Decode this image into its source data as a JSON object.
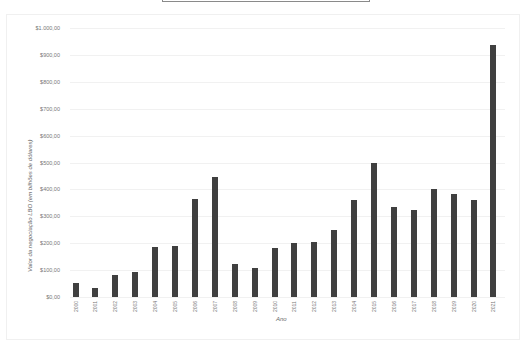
{
  "chart_data": {
    "type": "bar",
    "title": "",
    "xlabel": "Ano",
    "ylabel": "Valor da negociação LBO (em bilhões de dólares)",
    "categories": [
      "2000",
      "2001",
      "2002",
      "2003",
      "2004",
      "2005",
      "2006",
      "2007",
      "2008",
      "2009",
      "2010",
      "2011",
      "2012",
      "2013",
      "2014",
      "2015",
      "2016",
      "2017",
      "2018",
      "2019",
      "2020",
      "2021"
    ],
    "values": [
      52,
      33,
      80,
      92,
      186,
      190,
      364,
      447,
      123,
      108,
      182,
      200,
      204,
      249,
      360,
      498,
      335,
      323,
      401,
      383,
      361,
      937
    ],
    "ylim": [
      0,
      1000
    ],
    "yticks": [
      0,
      100,
      200,
      300,
      400,
      500,
      600,
      700,
      800,
      900,
      1000
    ],
    "ytick_labels": [
      "$0,00",
      "$100,00",
      "$200,00",
      "$300,00",
      "$400,00",
      "$500,00",
      "$600,00",
      "$700,00",
      "$800,00",
      "$900,00",
      "$1.000,00"
    ],
    "grid": true,
    "legend": "none",
    "bar_color": "#404040"
  }
}
